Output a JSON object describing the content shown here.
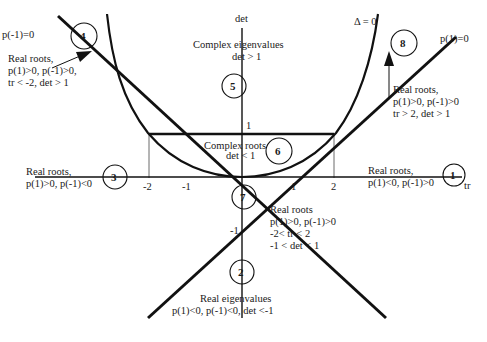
{
  "axes": {
    "x_label": "tr",
    "y_label": "det",
    "x_ticks": [
      "-2",
      "-1",
      "1",
      "2"
    ],
    "y_ticks": [
      "1",
      "-1"
    ]
  },
  "curves": {
    "discriminant": "Δ = 0",
    "p_plus_one": "p(1)=0",
    "p_minus_one": "p(-1)=0"
  },
  "regions": [
    {
      "id": "1",
      "lines": [
        "Real roots,",
        "p(1)<0, p(-1)>0"
      ]
    },
    {
      "id": "2",
      "lines": [
        "Real eigenvalues",
        "p(1)<0, p(-1)<0, det <-1"
      ]
    },
    {
      "id": "3",
      "lines": [
        "Real roots,",
        "p(1)>0, p(-1)<0"
      ]
    },
    {
      "id": "4",
      "lines": [
        "Real roots,",
        "p(1)>0, p(-1)>0,",
        "tr < -2, det > 1"
      ]
    },
    {
      "id": "5",
      "lines": [
        "Complex eigenvalues",
        "det > 1"
      ]
    },
    {
      "id": "6",
      "lines": [
        "Complex roots",
        "det < 1"
      ]
    },
    {
      "id": "7",
      "lines": [
        "Real roots",
        "p(1)>0, p(-1)>0",
        "-2< tr < 2",
        "-1 < det < 1"
      ]
    },
    {
      "id": "8",
      "lines": [
        "Real roots,",
        "p(1)>0, p(-1)>0",
        "tr > 2, det > 1"
      ]
    }
  ],
  "colors": {
    "ink": "#111111",
    "background": "#ffffff"
  }
}
